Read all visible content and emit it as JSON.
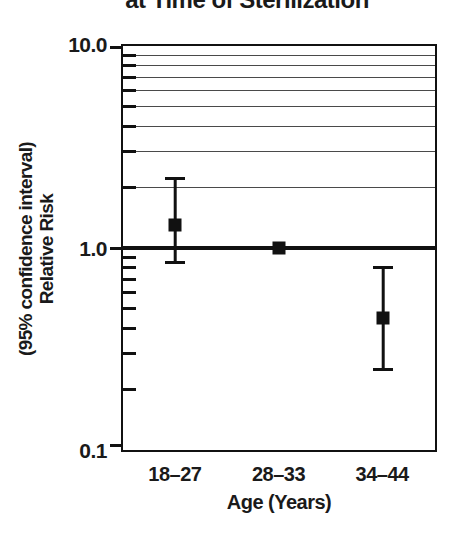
{
  "colors": {
    "ink": "#111111",
    "grid": "#4a4a4a",
    "background": "#ffffff"
  },
  "chart_data": {
    "type": "scatter",
    "title_partial": "at Time of Sterilization",
    "xlabel": "Age (Years)",
    "ylabel_line1": "Relative Risk",
    "ylabel_line2": "(95% confidence interval)",
    "yscale": "log",
    "ylim": [
      0.1,
      10
    ],
    "grid": "horizontal, values 2-9 only",
    "legend": null,
    "ytick_labels": [
      {
        "value": 10,
        "label": "10.0"
      },
      {
        "value": 1,
        "label": "1.0"
      },
      {
        "value": 0.1,
        "label": "0.1"
      }
    ],
    "gridline_values": [
      9,
      8,
      7,
      6,
      5,
      4,
      3,
      2
    ],
    "minor_tick_values": [
      9,
      8,
      7,
      6,
      5,
      4,
      3,
      2,
      0.9,
      0.8,
      0.7,
      0.6,
      0.5,
      0.4,
      0.3,
      0.2
    ],
    "reference_line": 1.0,
    "categories": [
      "18–27",
      "28–33",
      "34–44"
    ],
    "series": [
      {
        "category": "18–27",
        "rr": 1.3,
        "ci_low": 0.85,
        "ci_high": 2.2
      },
      {
        "category": "28–33",
        "rr": 1.0,
        "ci_low": null,
        "ci_high": null,
        "reference": true
      },
      {
        "category": "34–44",
        "rr": 0.45,
        "ci_low": 0.25,
        "ci_high": 0.8
      }
    ]
  }
}
